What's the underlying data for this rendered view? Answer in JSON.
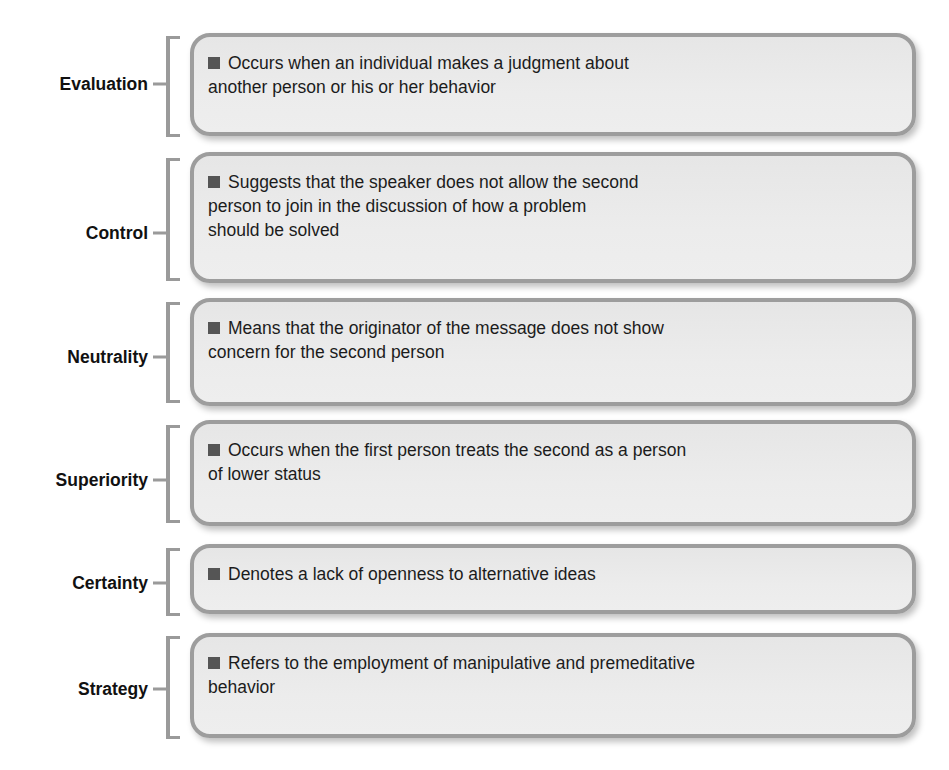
{
  "diagram": {
    "type": "defensive-communication-behaviors",
    "accent_colors": {
      "box_border": "#9d9d9d",
      "box_fill": "#e9e9e9",
      "bracket": "#9a9a9a",
      "bullet": "#555555",
      "text": "#1c1c1c"
    },
    "items": [
      {
        "label": "Evaluation",
        "lines": [
          "Occurs when an individual makes a judgment about",
          "another person or his or her behavior"
        ]
      },
      {
        "label": "Control",
        "lines": [
          "Suggests that the speaker does not allow the second",
          "person to join in the discussion of how a problem",
          "should be solved"
        ]
      },
      {
        "label": "Neutrality",
        "lines": [
          "Means that the originator of the message does not show",
          "concern for the second person"
        ]
      },
      {
        "label": "Superiority",
        "lines": [
          "Occurs when the first person treats the second as a person",
          "of lower status"
        ]
      },
      {
        "label": "Certainty",
        "lines": [
          "Denotes a lack of openness to alternative ideas"
        ]
      },
      {
        "label": "Strategy",
        "lines": [
          "Refers to the employment of manipulative and premeditative",
          "behavior"
        ]
      }
    ]
  }
}
